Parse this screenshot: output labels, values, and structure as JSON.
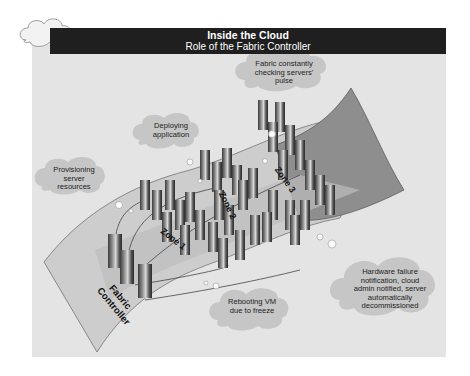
{
  "header": {
    "title": "Inside the Cloud",
    "subtitle": "Role of the Fabric Controller"
  },
  "colors": {
    "panel_bg": "#e4e4e4",
    "header_bg": "#1f1f1f",
    "cloud_fill": "#c4c4c4",
    "sheet_light": "#cfcfcf",
    "sheet_dark": "#8c8c8c"
  },
  "callouts": [
    {
      "id": "pulse",
      "text": "Fabric constantly checking servers' pulse"
    },
    {
      "id": "deploy",
      "text": "Deploying application"
    },
    {
      "id": "provision",
      "text": "Provisioning server resources"
    },
    {
      "id": "hardware",
      "text": "Hardware failure notification, cloud admin notified, server automatically decommissioned"
    },
    {
      "id": "reboot",
      "text": "Rebooting VM due to freeze"
    }
  ],
  "zones": [
    "Zone 1",
    "Zone 2",
    "Zone 3"
  ],
  "controller_label": "Fabric Controller"
}
